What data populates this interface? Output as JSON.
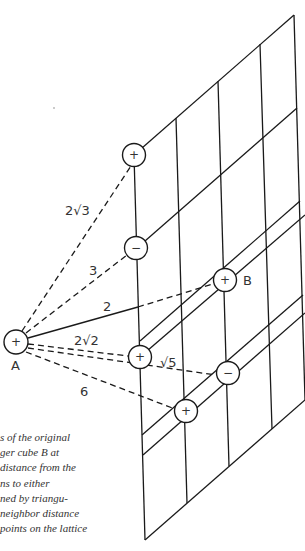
{
  "figure": {
    "lattice": {
      "description": "slanted square lattice plane",
      "columns": 4,
      "rows": 5
    },
    "points": {
      "A": {
        "label": "A",
        "sign": "+"
      },
      "B": {
        "label": "B",
        "sign": "+"
      },
      "lattice_top": {
        "sign": "+"
      },
      "lattice_minus_1": {
        "sign": "−"
      },
      "lattice_plus_mid": {
        "sign": "+"
      },
      "lattice_minus_2": {
        "sign": "−"
      },
      "lattice_plus_bottom": {
        "sign": "+"
      }
    },
    "distances": [
      {
        "label": "2√3",
        "to": "lattice_top",
        "style": "dashed"
      },
      {
        "label": "3",
        "to": "lattice_minus_1",
        "style": "dashed"
      },
      {
        "label": "2",
        "to": "lattice_plane",
        "style": "solid"
      },
      {
        "label": "2√2",
        "to": "lattice_plus_mid",
        "style": "dashed"
      },
      {
        "label": "√5",
        "to": "lattice_minus_2",
        "style": "dashed"
      },
      {
        "label": "6",
        "to": "lattice_plus_bottom",
        "style": "dashed"
      }
    ]
  },
  "caption": {
    "lines": [
      "s of the original",
      "ger cube B at",
      "distance from the",
      "ns to either",
      "ned by triangu-",
      " neighbor distance",
      "points on the lattice"
    ]
  }
}
